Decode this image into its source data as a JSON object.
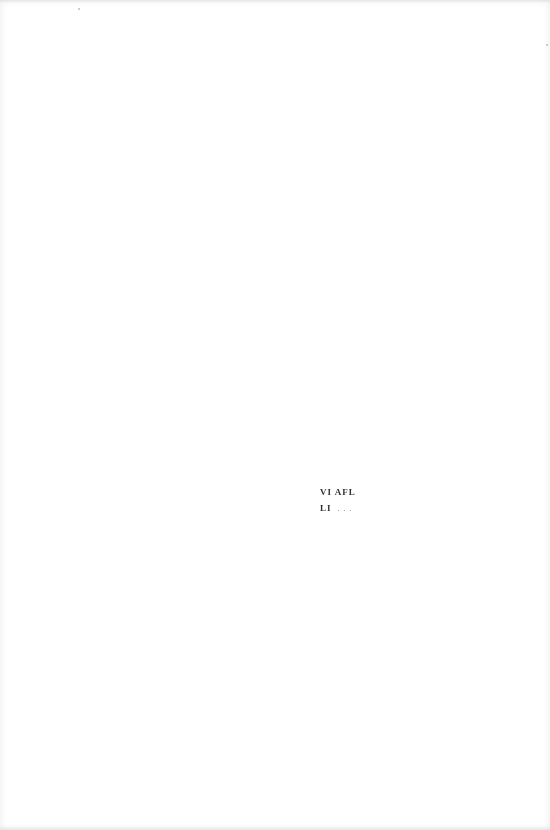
{
  "page": {
    "background": "#ffffff"
  },
  "text_fragment": {
    "lines": [
      {
        "text": "VI AFL",
        "trailing": ""
      },
      {
        "text": "LI",
        "trailing": ". . ."
      }
    ],
    "color": "#1a1a1a"
  }
}
